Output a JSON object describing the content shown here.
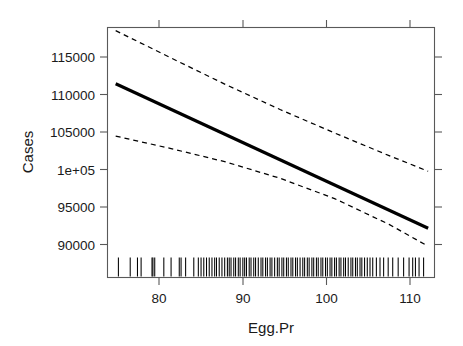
{
  "chart_data": {
    "type": "line",
    "title": "",
    "subtitle": "",
    "xlabel": "Egg.Pr",
    "ylabel": "Cases",
    "xlim": [
      75.0,
      111.0
    ],
    "ylim": [
      86500,
      118500
    ],
    "xticks": [
      80,
      90,
      100,
      110
    ],
    "xticklabels": [
      "80",
      "90",
      "100",
      "110"
    ],
    "yticks": [
      90000,
      95000,
      100000,
      105000,
      110000,
      115000
    ],
    "yticklabels": [
      "90000",
      "95000",
      "1e+05",
      "105000",
      "110000",
      "115000"
    ],
    "grid": false,
    "legend": null,
    "box": true,
    "ticks_both_sides": true,
    "series": [
      {
        "name": "fit",
        "style": "solid",
        "color": "#000000",
        "x": [
          75.9,
          110.3
        ],
        "y": [
          111300,
          92800
        ]
      },
      {
        "name": "upper-confidence-band",
        "style": "dashed",
        "color": "#000000",
        "x": [
          75.9,
          82.0,
          88.0,
          94.0,
          100.0,
          106.0,
          110.3
        ],
        "y": [
          118100,
          114600,
          111200,
          108000,
          105000,
          102100,
          100100
        ]
      },
      {
        "name": "lower-confidence-band",
        "style": "dashed",
        "color": "#000000",
        "x": [
          75.9,
          82.0,
          88.0,
          94.0,
          100.0,
          106.0,
          110.3
        ],
        "y": [
          104600,
          103000,
          101300,
          99200,
          96600,
          93300,
          90500
        ]
      }
    ],
    "rug": {
      "name": "rug-plot",
      "axis": "x",
      "position": "bottom",
      "values": [
        76.2,
        77.5,
        78.3,
        78.7,
        79.9,
        80.0,
        80.2,
        81.2,
        82.0,
        82.9,
        83.1,
        83.6,
        84.5,
        85.0,
        85.3,
        85.6,
        85.9,
        86.2,
        86.5,
        86.8,
        87.0,
        87.3,
        87.6,
        87.9,
        88.2,
        88.4,
        88.6,
        88.9,
        89.1,
        89.4,
        89.6,
        89.9,
        90.1,
        90.3,
        90.6,
        90.8,
        91.1,
        91.3,
        91.6,
        91.9,
        92.1,
        92.4,
        92.6,
        92.9,
        93.1,
        93.4,
        93.7,
        93.9,
        94.2,
        94.4,
        94.7,
        94.9,
        95.2,
        95.4,
        95.7,
        95.9,
        96.2,
        96.5,
        96.7,
        97.0,
        97.2,
        97.5,
        97.7,
        98.0,
        98.2,
        98.5,
        98.7,
        99.0,
        99.2,
        99.5,
        99.7,
        100.0,
        100.2,
        100.5,
        100.7,
        101.0,
        101.2,
        101.5,
        101.8,
        102.0,
        102.3,
        102.5,
        102.8,
        103.0,
        103.3,
        103.6,
        103.9,
        104.2,
        104.6,
        105.0,
        105.4,
        105.9,
        106.4,
        107.0,
        107.6,
        108.2,
        108.6,
        108.9,
        109.3,
        109.8
      ]
    }
  },
  "axes": {
    "x_title": "Egg.Pr",
    "y_title": "Cases"
  }
}
